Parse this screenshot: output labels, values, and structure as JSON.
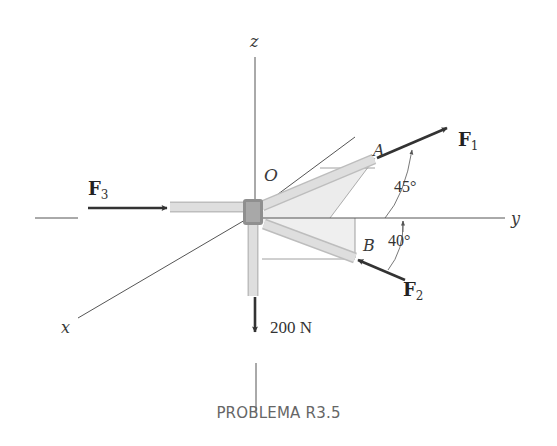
{
  "figure": {
    "caption": "PROBLEMA R3.5",
    "axes": {
      "x": "x",
      "y": "y",
      "z": "z"
    },
    "origin_label": "O",
    "points": {
      "A": "A",
      "B": "B"
    },
    "forces": {
      "F1": {
        "symbol": "F",
        "subscript": "1"
      },
      "F2": {
        "symbol": "F",
        "subscript": "2"
      },
      "F3": {
        "symbol": "F",
        "subscript": "3"
      },
      "weight": "200 N"
    },
    "angles": {
      "F1_angle": "45°",
      "F2_angle": "40°"
    },
    "colors": {
      "axis": "#555555",
      "arrow": "#333333",
      "pipe_fill": "#d9d9d9",
      "joint": "#8f8f8f",
      "plane_shade": "#ececec",
      "caption": "#666666"
    }
  }
}
